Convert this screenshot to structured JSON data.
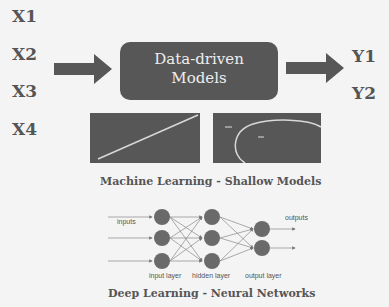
{
  "inputs": [
    "X1",
    "X2",
    "X3",
    "X4"
  ],
  "outputs": [
    "Y1",
    "Y2"
  ],
  "model_box": {
    "line1": "Data-driven",
    "line2": "Models"
  },
  "shallow": {
    "caption": "Machine Learning - Shallow Models",
    "panels": [
      "linear-regression-plot",
      "ellipse-classification-plot"
    ]
  },
  "deep": {
    "caption": "Deep Learning - Neural Networks",
    "labels": {
      "inputs": "inputs",
      "outputs": "outputs",
      "input_layer": "input layer",
      "hidden_layer": "hidden layer",
      "output_layer": "output layer"
    },
    "layers": [
      3,
      3,
      2
    ]
  },
  "colors": {
    "background": "#f4f4f4",
    "box": "#575757",
    "text": "#555555",
    "node": "#6a6a6a"
  }
}
